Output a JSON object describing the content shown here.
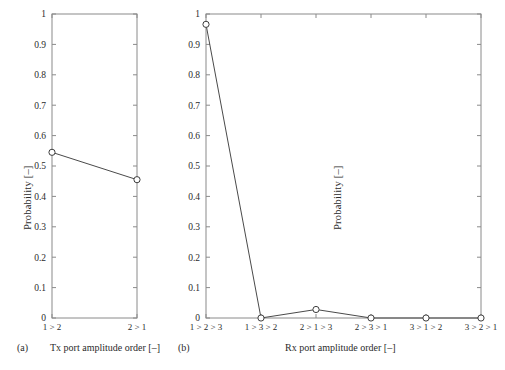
{
  "figure": {
    "panel_a_tag": "(a)",
    "panel_b_tag": "(b)",
    "panel_a_caption": "Tx port amplitude order [–]",
    "panel_b_caption": "Rx port amplitude order [–]",
    "ghost_text": ""
  },
  "style": {
    "axis_color": "#8a8a8a",
    "line_color": "#4a4a4a",
    "marker_edge": "#3d3d3d",
    "marker_fill": "#ffffff",
    "text_color": "#2b2b2b"
  },
  "chart_data": [
    {
      "type": "line",
      "id": "panel-a",
      "panel_label": "(a)",
      "title": "",
      "xlabel": "Tx port amplitude order [–]",
      "ylabel": "Probability [–]",
      "categories": [
        "1 > 2",
        "2 > 1"
      ],
      "values": [
        0.545,
        0.455
      ],
      "ylim": [
        0,
        1
      ],
      "yticks": [
        0,
        0.1,
        0.2,
        0.3,
        0.4,
        0.5,
        0.6,
        0.7,
        0.8,
        0.9,
        1
      ],
      "ytick_labels": [
        "0",
        "0.1",
        "0.2",
        "0.3",
        "0.4",
        "0.5",
        "0.6",
        "0.7",
        "0.8",
        "0.9",
        "1"
      ],
      "grid": false,
      "legend": "none",
      "marker": "circle-open"
    },
    {
      "type": "line",
      "id": "panel-b",
      "panel_label": "(b)",
      "title": "",
      "xlabel": "Rx port amplitude order [–]",
      "ylabel": "Probability [–]",
      "categories": [
        "1 > 2 > 3",
        "1 > 3 > 2",
        "2 > 1 > 3",
        "2 > 3 > 1",
        "3 > 1 > 2",
        "3 > 2 > 1"
      ],
      "values": [
        0.966,
        0.0,
        0.028,
        0.0,
        0.0,
        0.0
      ],
      "ylim": [
        0,
        1
      ],
      "yticks": [
        0,
        0.1,
        0.2,
        0.3,
        0.4,
        0.5,
        0.6,
        0.7,
        0.8,
        0.9,
        1
      ],
      "ytick_labels": [
        "0",
        "0.1",
        "0.2",
        "0.3",
        "0.4",
        "0.5",
        "0.6",
        "0.7",
        "0.8",
        "0.9",
        "1"
      ],
      "grid": false,
      "legend": "none",
      "marker": "circle-open"
    }
  ]
}
